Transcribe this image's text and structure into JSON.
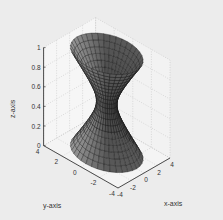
{
  "chart_data": {
    "type": "surface3d",
    "title": "",
    "surface": "hyperboloid of one sheet",
    "xlabel": "x-axis",
    "ylabel": "y-axis",
    "zlabel": "z-axis",
    "xlim": [
      -4,
      4
    ],
    "ylim": [
      -4,
      4
    ],
    "zlim": [
      0,
      1
    ],
    "xticks": [
      "-4",
      "-2",
      "0",
      "2",
      "4"
    ],
    "yticks": [
      "-4",
      "-2",
      "0",
      "2",
      "4"
    ],
    "zticks": [
      "0",
      "0.2",
      "0.4",
      "0.6",
      "0.8",
      "1"
    ],
    "radius_profile": {
      "z": [
        0,
        0.25,
        0.5,
        0.75,
        1
      ],
      "r": [
        3.2,
        1.7,
        0.9,
        1.7,
        3.2
      ]
    },
    "grid": true,
    "colormap": "gray",
    "colors": {
      "background": "#ececec",
      "axes_face": "#f4f4f4",
      "surface_dark": "#2a2a2a",
      "surface_light": "#9a9a9a"
    }
  }
}
